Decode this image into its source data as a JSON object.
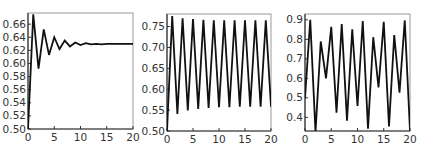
{
  "chart_data": [
    {
      "type": "line",
      "title": "",
      "xlabel": "",
      "ylabel": "",
      "xlim": [
        0,
        20
      ],
      "ylim": [
        0.5,
        0.677
      ],
      "grid": false,
      "legend": null,
      "x_ticks": [
        0,
        5,
        10,
        15,
        20
      ],
      "x_tick_labels": [
        "0",
        "5",
        "10",
        "15",
        "20"
      ],
      "y_ticks": [
        0.5,
        0.52,
        0.54,
        0.56,
        0.58,
        0.6,
        0.62,
        0.64,
        0.66
      ],
      "y_tick_labels": [
        "0.50",
        "0.52",
        "0.54",
        "0.56",
        "0.58",
        "0.60",
        "0.62",
        "0.64",
        "0.66"
      ],
      "x": [
        0,
        1,
        2,
        3,
        4,
        5,
        6,
        7,
        8,
        9,
        10,
        11,
        12,
        13,
        14,
        15,
        16,
        17,
        18,
        19,
        20
      ],
      "values": [
        0.5,
        0.675,
        0.592,
        0.652,
        0.613,
        0.64,
        0.622,
        0.635,
        0.626,
        0.632,
        0.628,
        0.631,
        0.629,
        0.63,
        0.629,
        0.63,
        0.63,
        0.63,
        0.63,
        0.63,
        0.63
      ],
      "series": [
        {
          "name": "x_n",
          "color": "#111111"
        }
      ]
    },
    {
      "type": "line",
      "title": "",
      "xlabel": "",
      "ylabel": "",
      "xlim": [
        0,
        20
      ],
      "ylim": [
        0.5,
        0.78
      ],
      "grid": false,
      "legend": null,
      "x_ticks": [
        0,
        5,
        10,
        15,
        20
      ],
      "x_tick_labels": [
        "0",
        "5",
        "10",
        "15",
        "20"
      ],
      "y_ticks": [
        0.5,
        0.55,
        0.6,
        0.65,
        0.7,
        0.75
      ],
      "y_tick_labels": [
        "0.50",
        "0.55",
        "0.60",
        "0.65",
        "0.70",
        "0.75"
      ],
      "x": [
        0,
        1,
        2,
        3,
        4,
        5,
        6,
        7,
        8,
        9,
        10,
        11,
        12,
        13,
        14,
        15,
        16,
        17,
        18,
        19,
        20
      ],
      "values": [
        0.5,
        0.775,
        0.541,
        0.77,
        0.549,
        0.768,
        0.553,
        0.766,
        0.555,
        0.765,
        0.557,
        0.765,
        0.557,
        0.765,
        0.558,
        0.765,
        0.558,
        0.765,
        0.558,
        0.765,
        0.558
      ],
      "series": [
        {
          "name": "x_n",
          "color": "#111111"
        }
      ]
    },
    {
      "type": "line",
      "title": "",
      "xlabel": "",
      "ylabel": "",
      "xlim": [
        0,
        20
      ],
      "ylim": [
        0.33,
        0.93
      ],
      "grid": false,
      "legend": null,
      "x_ticks": [
        0,
        5,
        10,
        15,
        20
      ],
      "x_tick_labels": [
        "0",
        "5",
        "10",
        "15",
        "20"
      ],
      "y_ticks": [
        0.4,
        0.5,
        0.6,
        0.7,
        0.8,
        0.9
      ],
      "y_tick_labels": [
        "0.4",
        "0.5",
        "0.6",
        "0.7",
        "0.8",
        "0.9"
      ],
      "x": [
        0,
        1,
        2,
        3,
        4,
        5,
        6,
        7,
        8,
        9,
        10,
        11,
        12,
        13,
        14,
        15,
        16,
        17,
        18,
        19,
        20
      ],
      "values": [
        0.5,
        0.9,
        0.324,
        0.789,
        0.6,
        0.864,
        0.424,
        0.879,
        0.383,
        0.851,
        0.458,
        0.894,
        0.342,
        0.811,
        0.553,
        0.89,
        0.353,
        0.822,
        0.527,
        0.897,
        0.332
      ],
      "series": [
        {
          "name": "x_n",
          "color": "#111111"
        }
      ]
    }
  ],
  "panels": [
    {
      "box": {
        "left": 28,
        "top": 13,
        "right": 133,
        "bottom": 129
      }
    },
    {
      "box": {
        "left": 167,
        "top": 14,
        "right": 271,
        "bottom": 131
      }
    },
    {
      "box": {
        "left": 305,
        "top": 14,
        "right": 410,
        "bottom": 131
      }
    }
  ]
}
